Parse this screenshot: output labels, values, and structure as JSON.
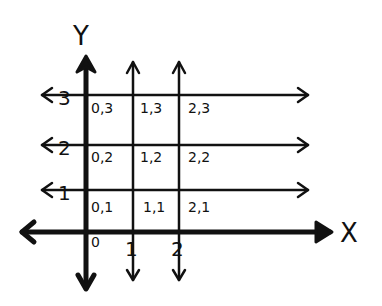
{
  "diagram": {
    "title": "",
    "axes": {
      "x_label": "X",
      "y_label": "Y",
      "origin_label": "0",
      "x_ticks": [
        "1",
        "2"
      ],
      "y_ticks": [
        "1",
        "2",
        "3"
      ]
    },
    "cells": [
      {
        "label": "0,3",
        "x": 0,
        "y": 3
      },
      {
        "label": "1,3",
        "x": 1,
        "y": 3
      },
      {
        "label": "2,3",
        "x": 2,
        "y": 3
      },
      {
        "label": "0,2",
        "x": 0,
        "y": 2
      },
      {
        "label": "1,2",
        "x": 1,
        "y": 2
      },
      {
        "label": "2,2",
        "x": 2,
        "y": 2
      },
      {
        "label": "0,1",
        "x": 0,
        "y": 1
      },
      {
        "label": "1,1",
        "x": 1,
        "y": 1
      },
      {
        "label": "2,1",
        "x": 2,
        "y": 1
      }
    ],
    "colors": {
      "ink": "#111111",
      "background": "#ffffff"
    }
  }
}
